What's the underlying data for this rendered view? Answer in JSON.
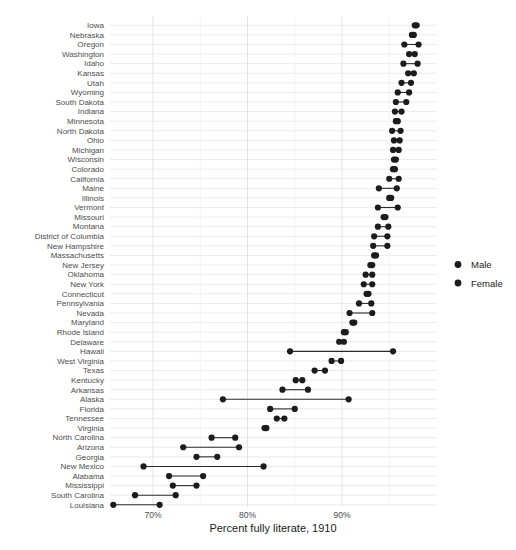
{
  "chart_data": {
    "type": "scatter",
    "subtype": "dumbbell-dot-plot",
    "xlabel": "Percent fully literate, 1910",
    "xticks": [
      {
        "label": "70%",
        "value": 70
      },
      {
        "label": "80%",
        "value": 80
      },
      {
        "label": "90%",
        "value": 90
      }
    ],
    "xlim": [
      65,
      100.3
    ],
    "grid": "on",
    "legend_position": "right",
    "dot_color": "#1c1c1c",
    "connector_color": "#2b2b2b",
    "categories": [
      "Iowa",
      "Nebraska",
      "Oregon",
      "Washington",
      "Idaho",
      "Kansas",
      "Utah",
      "Wyoming",
      "South Dakota",
      "Indiana",
      "Minnesota",
      "North Dakota",
      "Ohio",
      "Michigan",
      "Wisconsin",
      "Colorado",
      "California",
      "Maine",
      "Illinois",
      "Vermont",
      "Missouri",
      "Montana",
      "District of Columbia",
      "New Hampshire",
      "Massachusetts",
      "New Jersey",
      "Oklahoma",
      "New York",
      "Connecticut",
      "Pennsylvania",
      "Nevada",
      "Maryland",
      "Rhode Island",
      "Delaware",
      "Hawaii",
      "West Virginia",
      "Texas",
      "Kentucky",
      "Arkansas",
      "Alaska",
      "Florida",
      "Tennessee",
      "Virginia",
      "North Carolina",
      "Arizona",
      "Georgia",
      "New Mexico",
      "Alabama",
      "Mississippi",
      "South Carolina",
      "Louisiana"
    ],
    "series": [
      {
        "name": "Male",
        "values": [
          97.9,
          97.6,
          98.1,
          97.7,
          98.0,
          97.6,
          97.3,
          97.1,
          96.8,
          96.3,
          95.9,
          96.2,
          96.1,
          96.0,
          95.7,
          95.6,
          96.0,
          95.8,
          95.2,
          95.9,
          94.6,
          94.9,
          94.8,
          94.8,
          93.6,
          93.2,
          93.2,
          93.2,
          92.8,
          93.1,
          93.2,
          91.3,
          90.4,
          90.2,
          95.4,
          89.9,
          88.2,
          85.8,
          86.4,
          90.7,
          85.0,
          83.9,
          82.0,
          78.7,
          79.1,
          76.8,
          81.7,
          75.3,
          74.6,
          72.4,
          70.7
        ]
      },
      {
        "name": "Female",
        "values": [
          97.7,
          97.4,
          96.6,
          97.1,
          96.5,
          97.0,
          96.3,
          95.9,
          95.7,
          95.6,
          95.7,
          95.3,
          95.5,
          95.4,
          95.5,
          95.4,
          95.0,
          93.9,
          95.0,
          93.8,
          94.4,
          93.8,
          93.4,
          93.3,
          93.4,
          93.0,
          92.5,
          92.3,
          92.6,
          91.8,
          90.8,
          91.1,
          90.2,
          89.7,
          84.5,
          88.9,
          87.1,
          85.1,
          83.7,
          77.4,
          82.4,
          83.1,
          81.8,
          76.2,
          73.2,
          74.6,
          69.0,
          71.7,
          72.1,
          68.1,
          65.8
        ]
      }
    ]
  }
}
